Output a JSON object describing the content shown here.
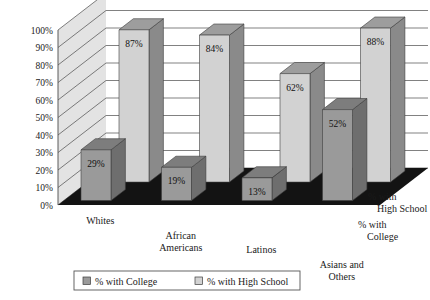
{
  "chart_data": {
    "type": "bar",
    "title": "",
    "subtitle": "",
    "xlabel": "",
    "ylabel": "",
    "ylim": [
      0,
      100
    ],
    "grid": true,
    "projection": "3d-isometric",
    "legend_position": "bottom",
    "categories": [
      "Whites",
      "African Americans",
      "Latinos",
      "Asians and Others"
    ],
    "category_lines": [
      [
        "Whites"
      ],
      [
        "African",
        "Americans"
      ],
      [
        "Latinos"
      ],
      [
        "Asians and",
        "Others"
      ]
    ],
    "series": [
      {
        "name": "% with College",
        "values": [
          29,
          19,
          13,
          52
        ],
        "labels": [
          "29%",
          "19%",
          "13%",
          "52%"
        ],
        "color": "#9a9a9a"
      },
      {
        "name": "% with High School",
        "values": [
          87,
          84,
          62,
          88
        ],
        "labels": [
          "87%",
          "84%",
          "62%",
          "88%"
        ],
        "color": "#d2d2d2"
      }
    ],
    "y_ticks": [
      0,
      10,
      20,
      30,
      40,
      50,
      60,
      70,
      80,
      90,
      100
    ],
    "y_tick_labels": [
      "0%",
      "10%",
      "20%",
      "30%",
      "40%",
      "50%",
      "60%",
      "70%",
      "80%",
      "90%",
      "100%"
    ],
    "depth_axis_labels": [
      [
        "% with",
        "High School"
      ],
      [
        "% with",
        "College"
      ]
    ]
  },
  "legend": {
    "items": [
      {
        "label": "% with College",
        "color": "#9a9a9a"
      },
      {
        "label": "% with High School",
        "color": "#d2d2d2"
      }
    ]
  },
  "colors": {
    "floor": "#131313",
    "left_wall": "#e3e3e3",
    "back_wall": "#ffffff",
    "grid_line": "#4a4a4a",
    "college_front": "#9a9a9a",
    "college_top": "#7d7d7d",
    "college_side": "#6e6e6e",
    "highschool_front": "#d2d2d2",
    "highschool_top": "#9d9d9d",
    "highschool_side": "#8a8a8a",
    "text": "#1a1a1a",
    "legend_border": "#555555"
  }
}
